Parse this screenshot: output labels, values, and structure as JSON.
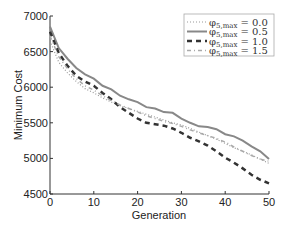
{
  "chart_data": {
    "type": "line",
    "title": "",
    "xlabel": "Generation",
    "ylabel": "Minimum Cost",
    "xlim": [
      0,
      50
    ],
    "ylim": [
      4500,
      7000
    ],
    "xticks": [
      "0",
      "10",
      "20",
      "30",
      "40",
      "50"
    ],
    "yticks": [
      "4500",
      "5000",
      "5500",
      "6000",
      "6500",
      "7000"
    ],
    "grid": false,
    "legend_position": "upper right",
    "x": [
      0,
      2,
      4,
      6,
      8,
      10,
      12,
      14,
      16,
      18,
      20,
      22,
      24,
      26,
      28,
      30,
      32,
      34,
      36,
      38,
      40,
      42,
      44,
      46,
      48,
      50
    ],
    "series": [
      {
        "name": "φ5,max = 0.0",
        "style": "dotted",
        "values": [
          6650,
          6350,
          6200,
          6080,
          5980,
          5920,
          5850,
          5790,
          5740,
          5700,
          5660,
          5620,
          5580,
          5540,
          5500,
          5470,
          5420,
          5370,
          5320,
          5270,
          5210,
          5150,
          5100,
          5050,
          4990,
          4930
        ]
      },
      {
        "name": "φ5,max = 0.5",
        "style": "solid",
        "values": [
          6850,
          6550,
          6400,
          6270,
          6180,
          6120,
          6020,
          5970,
          5880,
          5830,
          5790,
          5720,
          5700,
          5650,
          5640,
          5560,
          5500,
          5450,
          5440,
          5410,
          5340,
          5310,
          5250,
          5170,
          5100,
          4990
        ]
      },
      {
        "name": "φ5,max = 1.0",
        "style": "dashed",
        "values": [
          6780,
          6480,
          6300,
          6160,
          6080,
          6020,
          5920,
          5830,
          5720,
          5640,
          5560,
          5500,
          5480,
          5460,
          5420,
          5360,
          5290,
          5240,
          5180,
          5100,
          5010,
          4940,
          4860,
          4770,
          4700,
          4650
        ]
      },
      {
        "name": "φ5,max = 1.5",
        "style": "dashdot",
        "values": [
          6720,
          6430,
          6260,
          6120,
          6020,
          5960,
          5880,
          5810,
          5750,
          5700,
          5650,
          5600,
          5560,
          5520,
          5490,
          5450,
          5400,
          5360,
          5320,
          5280,
          5230,
          5160,
          5100,
          5040,
          4990,
          4960
        ]
      }
    ]
  },
  "legend": {
    "items": [
      {
        "symbol": "φ",
        "sub": "5,max",
        "value": "= 0.0"
      },
      {
        "symbol": "φ",
        "sub": "5,max",
        "value": "= 0.5"
      },
      {
        "symbol": "φ",
        "sub": "5,max",
        "value": "= 1.0"
      },
      {
        "symbol": "φ",
        "sub": "5,max",
        "value": "= 1.5"
      }
    ]
  }
}
